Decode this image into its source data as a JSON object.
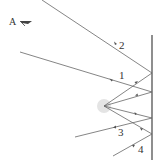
{
  "diagram": {
    "observer_label": "A",
    "observer_icon": "eye-icon",
    "ray_labels": [
      "2",
      "1",
      "3",
      "4"
    ],
    "colors": {
      "line": "#555555",
      "source_glow": "#dddddd"
    },
    "mirror": {
      "x": 152,
      "y1": 35,
      "y2": 160
    },
    "source": {
      "x": 104,
      "y": 106
    }
  }
}
